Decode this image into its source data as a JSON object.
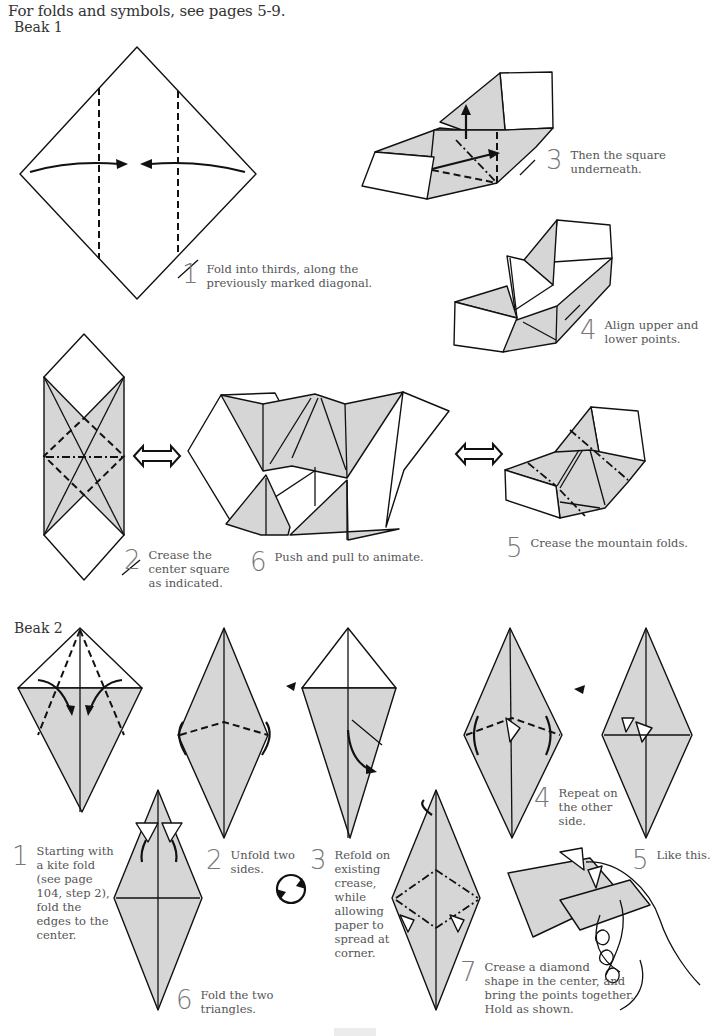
{
  "header": {
    "text": "For folds and symbols, see pages 5-9."
  },
  "sections": {
    "beak1": {
      "title": "Beak 1",
      "steps": [
        {
          "num": "1",
          "text": [
            "Fold into thirds, along the",
            "previously marked diagonal."
          ]
        },
        {
          "num": "2",
          "text": [
            "Crease the",
            "center square",
            "as indicated."
          ]
        },
        {
          "num": "3",
          "text": [
            "Then the square",
            "underneath."
          ]
        },
        {
          "num": "4",
          "text": [
            "Align upper and",
            "lower points."
          ]
        },
        {
          "num": "5",
          "text": [
            "Crease the mountain folds."
          ]
        },
        {
          "num": "6",
          "text": [
            "Push and pull to animate."
          ]
        }
      ]
    },
    "beak2": {
      "title": "Beak 2",
      "steps": [
        {
          "num": "1",
          "text": [
            "Starting with",
            "a kite fold",
            "(see page",
            "104, step 2),",
            "fold the",
            "edges to the",
            "center."
          ]
        },
        {
          "num": "2",
          "text": [
            "Unfold two",
            "sides."
          ]
        },
        {
          "num": "3",
          "text": [
            "Refold on",
            "existing",
            "crease,",
            "while",
            "allowing",
            "paper to",
            "spread at",
            "corner."
          ]
        },
        {
          "num": "4",
          "text": [
            "Repeat on",
            "the other",
            "side."
          ]
        },
        {
          "num": "5",
          "text": [
            "Like this."
          ]
        },
        {
          "num": "6",
          "text": [
            "Fold the two",
            "triangles."
          ]
        },
        {
          "num": "7",
          "text": [
            "Crease a diamond",
            "shape in the center, and",
            "bring the points together.",
            "Hold as shown."
          ]
        }
      ]
    }
  },
  "icons": {
    "double_arrow": "push-pull-double-arrow",
    "rotate": "turn-over-circle-arrow"
  },
  "colors": {
    "paper_shade": "#d6d6d6",
    "line": "#111111",
    "text": "#555555"
  }
}
